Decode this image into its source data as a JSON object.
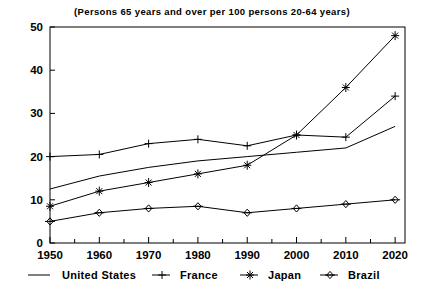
{
  "figure": {
    "cropped_top_text": "",
    "subtitle": "(Persons 65 years and over per 100 persons 20-64 years)"
  },
  "axes": {
    "y_ticks": [
      "0",
      "10",
      "20",
      "30",
      "40",
      "50"
    ],
    "x_ticks": [
      "1950",
      "1960",
      "1970",
      "1980",
      "1990",
      "2000",
      "2010",
      "2020"
    ]
  },
  "legend": {
    "items": [
      {
        "label": "United States",
        "marker": "line",
        "color": "#000000"
      },
      {
        "label": "France",
        "marker": "plus",
        "color": "#000000"
      },
      {
        "label": "Japan",
        "marker": "star",
        "color": "#000000"
      },
      {
        "label": "Brazil",
        "marker": "diamond",
        "color": "#000000"
      }
    ]
  },
  "chart_data": {
    "type": "line",
    "title": "",
    "subtitle": "(Persons 65 years and over per 100 persons 20-64 years)",
    "xlabel": "",
    "ylabel": "",
    "xlim": [
      1950,
      2022
    ],
    "ylim": [
      0,
      50
    ],
    "x": [
      1950,
      1960,
      1970,
      1980,
      1990,
      2000,
      2010,
      2020
    ],
    "grid": false,
    "legend_position": "bottom",
    "y_ticks": [
      0,
      10,
      20,
      30,
      40,
      50
    ],
    "x_ticks": [
      1950,
      1960,
      1970,
      1980,
      1990,
      2000,
      2010,
      2020
    ],
    "x_minor_tick_interval": 5,
    "series": [
      {
        "name": "United States",
        "marker": "none",
        "values": [
          12.5,
          15.5,
          17.5,
          19.0,
          20.0,
          21.0,
          22.0,
          27.0
        ]
      },
      {
        "name": "France",
        "marker": "plus",
        "values": [
          20.0,
          20.5,
          23.0,
          24.0,
          22.5,
          25.0,
          24.5,
          34.0
        ]
      },
      {
        "name": "Japan",
        "marker": "star",
        "values": [
          8.5,
          12.0,
          14.0,
          16.0,
          18.0,
          25.0,
          36.0,
          48.0
        ]
      },
      {
        "name": "Brazil",
        "marker": "diamond",
        "values": [
          5.0,
          7.0,
          8.0,
          8.5,
          7.0,
          8.0,
          9.0,
          10.0
        ]
      }
    ]
  }
}
